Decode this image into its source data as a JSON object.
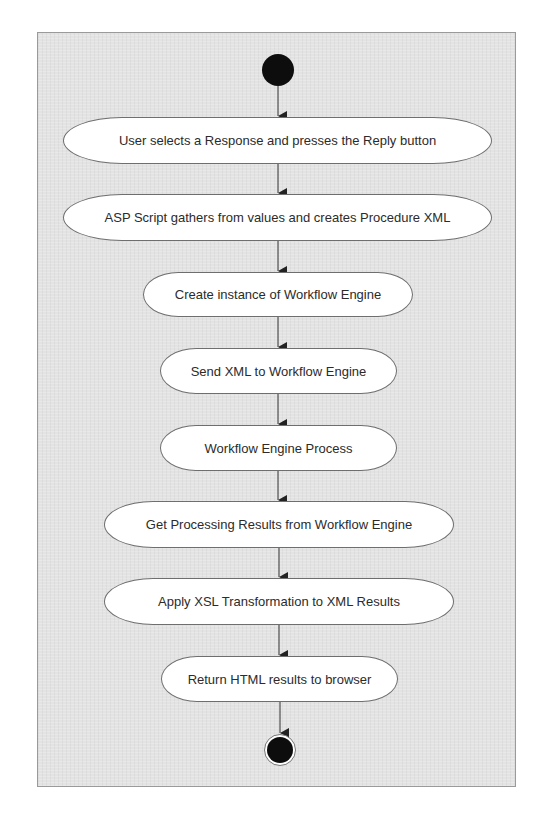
{
  "diagram": {
    "type": "uml-activity-diagram",
    "colors": {
      "background": "#e3e3e3",
      "frame_border": "#9a9a9a",
      "node_fill": "#ffffff",
      "node_border": "#6e6e6e",
      "start_end_fill": "#0d0d0d",
      "edge": "#333333"
    },
    "start_node": {
      "kind": "initial"
    },
    "activities": [
      {
        "id": "a1",
        "label": "User selects a Response and presses the Reply button"
      },
      {
        "id": "a2",
        "label": "ASP Script gathers from values and creates Procedure XML"
      },
      {
        "id": "a3",
        "label": "Create instance of Workflow Engine"
      },
      {
        "id": "a4",
        "label": "Send XML to Workflow Engine"
      },
      {
        "id": "a5",
        "label": "Workflow Engine Process"
      },
      {
        "id": "a6",
        "label": "Get Processing Results from Workflow Engine"
      },
      {
        "id": "a7",
        "label": "Apply XSL Transformation to XML Results"
      },
      {
        "id": "a8",
        "label": "Return HTML results to browser"
      }
    ],
    "end_node": {
      "kind": "final"
    },
    "edges": [
      {
        "from": "start",
        "to": "a1"
      },
      {
        "from": "a1",
        "to": "a2"
      },
      {
        "from": "a2",
        "to": "a3"
      },
      {
        "from": "a3",
        "to": "a4"
      },
      {
        "from": "a4",
        "to": "a5"
      },
      {
        "from": "a5",
        "to": "a6"
      },
      {
        "from": "a6",
        "to": "a7"
      },
      {
        "from": "a7",
        "to": "a8"
      },
      {
        "from": "a8",
        "to": "end"
      }
    ]
  }
}
